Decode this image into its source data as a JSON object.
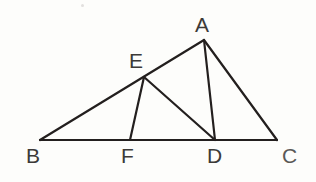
{
  "figure": {
    "kind": "geometry-diagram",
    "width": 316,
    "height": 182,
    "background_color": "#fdfdfb",
    "stroke_color": "#231f1e",
    "stroke_width": 2.2,
    "label_color": "#3c3a38"
  },
  "points": {
    "A": {
      "label": "A",
      "x": 204,
      "y": 40,
      "label_x": 195,
      "label_y": 14
    },
    "B": {
      "label": "B",
      "x": 40,
      "y": 140,
      "label_x": 26,
      "label_y": 145
    },
    "C": {
      "label": "C",
      "x": 277,
      "y": 140,
      "label_x": 282,
      "label_y": 145
    },
    "D": {
      "label": "D",
      "x": 215,
      "y": 140,
      "label_x": 207,
      "label_y": 145
    },
    "E": {
      "label": "E",
      "x": 144,
      "y": 77,
      "label_x": 129,
      "label_y": 50
    },
    "F": {
      "label": "F",
      "x": 130,
      "y": 140,
      "label_x": 121,
      "label_y": 145
    }
  },
  "segments": [
    {
      "name": "segment-BC",
      "from": "B",
      "to": "C",
      "x1": 40,
      "y1": 140,
      "x2": 277,
      "y2": 140
    },
    {
      "name": "segment-BA",
      "from": "B",
      "to": "A",
      "x1": 40,
      "y1": 140,
      "x2": 204,
      "y2": 40
    },
    {
      "name": "segment-AC",
      "from": "A",
      "to": "C",
      "x1": 204,
      "y1": 40,
      "x2": 277,
      "y2": 140
    },
    {
      "name": "segment-AD",
      "from": "A",
      "to": "D",
      "x1": 204,
      "y1": 40,
      "x2": 215,
      "y2": 140
    },
    {
      "name": "segment-ED",
      "from": "E",
      "to": "D",
      "x1": 144,
      "y1": 77,
      "x2": 215,
      "y2": 140
    },
    {
      "name": "segment-EF",
      "from": "E",
      "to": "F",
      "x1": 144,
      "y1": 77,
      "x2": 130,
      "y2": 140
    }
  ]
}
